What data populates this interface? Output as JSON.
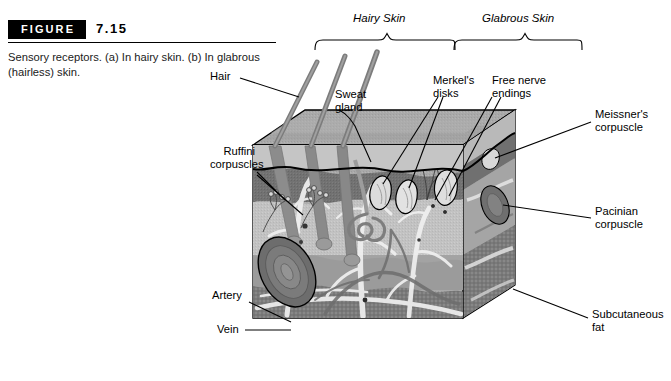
{
  "figure": {
    "badge": "FIGURE",
    "number": "7.15",
    "caption": "Sensory receptors. (a) In hairy skin. (b) In glabrous (hairless) skin."
  },
  "diagram": {
    "brace_labels": [
      {
        "id": "hairy-skin",
        "text": "Hairy Skin"
      },
      {
        "id": "glabrous-skin",
        "text": "Glabrous Skin"
      }
    ],
    "labels": [
      {
        "id": "hair",
        "text": "Hair"
      },
      {
        "id": "sweat-gland",
        "text": "Sweat\ngland"
      },
      {
        "id": "merkels-disks",
        "text": "Merkel's\ndisks"
      },
      {
        "id": "free-nerve-endings",
        "text": "Free nerve\nendings"
      },
      {
        "id": "meissners-corpuscle",
        "text": "Meissner's\ncorpuscle"
      },
      {
        "id": "pacinian-corpuscle",
        "text": "Pacinian\ncorpuscle"
      },
      {
        "id": "subcutaneous-fat",
        "text": "Subcutaneous\nfat"
      },
      {
        "id": "ruffini-corpuscles",
        "text": "Ruffini\ncorpuscles"
      },
      {
        "id": "artery",
        "text": "Artery"
      },
      {
        "id": "vein",
        "text": "Vein"
      }
    ],
    "colors": {
      "epidermis": "#b6b6b6",
      "dermis_upper": "#8f8f8f",
      "dermis_dark": "#6f6f6f",
      "dermis_light": "#c8c8c8",
      "subcutaneous": "#7d7d7d",
      "side_face": "#9a9a9a",
      "top_face": "#a8a8a8",
      "outline": "#000000",
      "vessel_light": "#efefef",
      "vessel_dark": "#6a6a6a"
    }
  }
}
